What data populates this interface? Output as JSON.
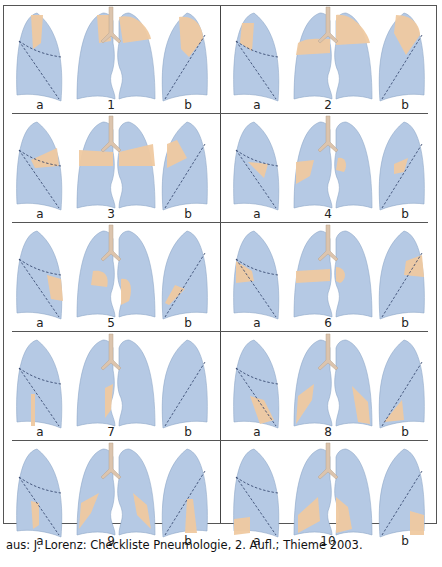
{
  "figure": {
    "caption": "aus: J. Lorenz: Checkliste Pneumologie, 2. Aufl.; Thieme 2003.",
    "colors": {
      "lung": "#b5c9e4",
      "lung_edge": "#8fa8c8",
      "consolidation": "#efc9a0",
      "trachea": "#dcc4ad",
      "frame": "#555555"
    },
    "panels": [
      {
        "number": "1",
        "lateral_left_label": "a",
        "lateral_right_label": "b",
        "region": "upper lobe apical"
      },
      {
        "number": "2",
        "lateral_left_label": "a",
        "lateral_right_label": "b",
        "region": "upper lobe posterior"
      },
      {
        "number": "3",
        "lateral_left_label": "a",
        "lateral_right_label": "b",
        "region": "upper lobe anterior"
      },
      {
        "number": "4",
        "lateral_left_label": "a",
        "lateral_right_label": "b",
        "region": "middle lobe / lingula"
      },
      {
        "number": "5",
        "lateral_left_label": "a",
        "lateral_right_label": "b",
        "region": "middle lobe medial / lingula inferior"
      },
      {
        "number": "6",
        "lateral_left_label": "a",
        "lateral_right_label": "b",
        "region": "lower lobe superior"
      },
      {
        "number": "7",
        "lateral_left_label": "a",
        "lateral_right_label": "b",
        "region": "lower lobe medial basal"
      },
      {
        "number": "8",
        "lateral_left_label": "a",
        "lateral_right_label": "b",
        "region": "lower lobe anterior basal"
      },
      {
        "number": "9",
        "lateral_left_label": "a",
        "lateral_right_label": "b",
        "region": "lower lobe lateral basal"
      },
      {
        "number": "10",
        "lateral_left_label": "a",
        "lateral_right_label": "b",
        "region": "lower lobe posterior basal"
      }
    ]
  }
}
